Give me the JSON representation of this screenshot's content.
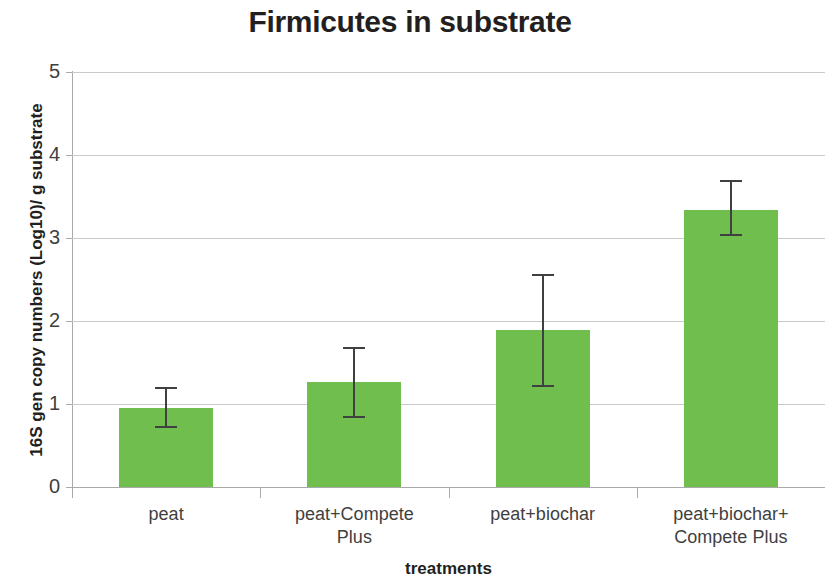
{
  "chart_data": {
    "type": "bar",
    "title": "Firmicutes in substrate",
    "xlabel": "treatments",
    "ylabel": "16S gen copy numbers (Log10)/ g substrate",
    "categories": [
      "peat",
      "peat+Compete Plus",
      "peat+biochar",
      "peat+biochar+Compete Plus"
    ],
    "category_lines": [
      [
        "peat"
      ],
      [
        "peat+Compete",
        "Plus"
      ],
      [
        "peat+biochar"
      ],
      [
        "peat+biochar+",
        "Compete Plus"
      ]
    ],
    "values": [
      0.95,
      1.26,
      1.89,
      3.34
    ],
    "errors_low": [
      0.71,
      0.83,
      1.21,
      3.02
    ],
    "errors_high": [
      1.2,
      1.69,
      2.57,
      3.7
    ],
    "ylim": [
      0,
      5
    ],
    "yticks": [
      0,
      1,
      2,
      3,
      4,
      5
    ],
    "ytick_labels": [
      "0",
      "1",
      "2",
      "3",
      "4",
      "5"
    ],
    "grid": true,
    "legend": false,
    "bar_color": "#70be4e",
    "error_color": "#404040",
    "gridline_color": "#c9c9c9",
    "axis_color": "#a9a9a9"
  }
}
